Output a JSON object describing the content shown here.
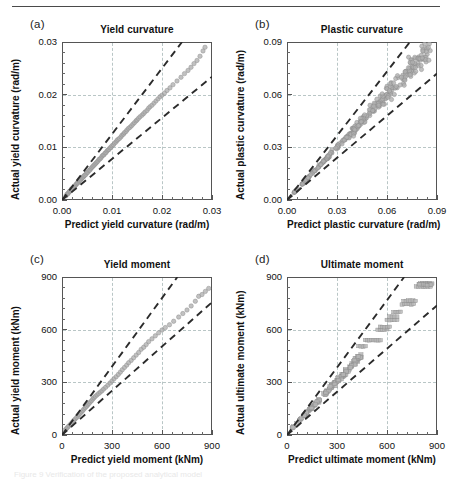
{
  "figure": {
    "rule": "horizontal-rule",
    "caption_faint": "Figure 9 Verification of the proposed analytical model"
  },
  "panels": [
    {
      "tag": "(a)",
      "title": "Yield curvature",
      "xlabel": "Predict yield curvature (rad/m)",
      "ylabel": "Actual yield curvature (rad/m)",
      "xticks": [
        "0.00",
        "0.01",
        "0.02",
        "0.03"
      ],
      "yticks": [
        "0.00",
        "0.01",
        "0.02",
        "0.03"
      ],
      "xlim": [
        0,
        0.03
      ],
      "ylim": [
        0,
        0.03
      ],
      "upper_band_slope": 1.25,
      "lower_band_slope": 0.78,
      "marker": "circle"
    },
    {
      "tag": "(b)",
      "title": "Plastic curvature",
      "xlabel": "Predict plastic curvature (rad/m)",
      "ylabel": "Actual plastic curvature (rad/m)",
      "xticks": [
        "0.00",
        "0.03",
        "0.06",
        "0.09"
      ],
      "yticks": [
        "0.00",
        "0.03",
        "0.06",
        "0.09"
      ],
      "xlim": [
        0,
        0.09
      ],
      "ylim": [
        0,
        0.09
      ],
      "upper_band_slope": 1.22,
      "lower_band_slope": 0.8,
      "marker": "circle"
    },
    {
      "tag": "(c)",
      "title": "Yield moment",
      "xlabel": "Predict yield moment (kNm)",
      "ylabel": "Actual yield moment (kNm)",
      "xticks": [
        "0",
        "300",
        "600",
        "900"
      ],
      "yticks": [
        "0",
        "300",
        "600",
        "900"
      ],
      "xlim": [
        0,
        900
      ],
      "ylim": [
        0,
        900
      ],
      "upper_band_slope": 1.3,
      "lower_band_slope": 0.84,
      "marker": "circle"
    },
    {
      "tag": "(d)",
      "title": "Ultimate moment",
      "xlabel": "Predict ultimate moment (kNm)",
      "ylabel": "Actual ultimate moment (kNm)",
      "xticks": [
        "0",
        "300",
        "600",
        "900"
      ],
      "yticks": [
        "0",
        "300",
        "600",
        "900"
      ],
      "xlim": [
        0,
        900
      ],
      "ylim": [
        0,
        900
      ],
      "upper_band_slope": 1.28,
      "lower_band_slope": 0.82,
      "marker": "square"
    }
  ],
  "chart_data": [
    {
      "type": "scatter",
      "panel": "(a)",
      "title": "Yield curvature",
      "xlabel": "Predict yield curvature (rad/m)",
      "ylabel": "Actual yield curvature (rad/m)",
      "xlim": [
        0,
        0.03
      ],
      "ylim": [
        0,
        0.03
      ],
      "xticks": [
        0,
        0.01,
        0.02,
        0.03
      ],
      "yticks": [
        0,
        0.01,
        0.02,
        0.03
      ],
      "grid": true,
      "legend": "none",
      "reference_lines": [
        {
          "name": "upper-bound",
          "style": "dashed",
          "slope": 1.25,
          "intercept": 0
        },
        {
          "name": "lower-bound",
          "style": "dashed",
          "slope": 0.78,
          "intercept": 0
        }
      ],
      "points": [
        [
          0.0008,
          0.0008
        ],
        [
          0.001,
          0.0011
        ],
        [
          0.0012,
          0.0012
        ],
        [
          0.0013,
          0.0014
        ],
        [
          0.0015,
          0.0016
        ],
        [
          0.0016,
          0.0017
        ],
        [
          0.0018,
          0.0018
        ],
        [
          0.0019,
          0.0021
        ],
        [
          0.002,
          0.0021
        ],
        [
          0.0022,
          0.0023
        ],
        [
          0.0023,
          0.0024
        ],
        [
          0.0025,
          0.0026
        ],
        [
          0.0026,
          0.0027
        ],
        [
          0.0028,
          0.0029
        ],
        [
          0.0029,
          0.0031
        ],
        [
          0.0031,
          0.0032
        ],
        [
          0.0032,
          0.0033
        ],
        [
          0.0034,
          0.0035
        ],
        [
          0.0035,
          0.0037
        ],
        [
          0.0037,
          0.0038
        ],
        [
          0.0038,
          0.004
        ],
        [
          0.004,
          0.0041
        ],
        [
          0.0041,
          0.0043
        ],
        [
          0.0043,
          0.0044
        ],
        [
          0.0044,
          0.0046
        ],
        [
          0.0046,
          0.0047
        ],
        [
          0.0048,
          0.0049
        ],
        [
          0.005,
          0.0052
        ],
        [
          0.0052,
          0.0053
        ],
        [
          0.0054,
          0.0056
        ],
        [
          0.0056,
          0.0057
        ],
        [
          0.0058,
          0.006
        ],
        [
          0.006,
          0.0062
        ],
        [
          0.0062,
          0.0064
        ],
        [
          0.0064,
          0.0066
        ],
        [
          0.0066,
          0.0068
        ],
        [
          0.0068,
          0.007
        ],
        [
          0.007,
          0.0072
        ],
        [
          0.0072,
          0.0074
        ],
        [
          0.0074,
          0.0077
        ],
        [
          0.0076,
          0.0078
        ],
        [
          0.0078,
          0.008
        ],
        [
          0.008,
          0.0083
        ],
        [
          0.0082,
          0.0085
        ],
        [
          0.0084,
          0.0086
        ],
        [
          0.0086,
          0.0089
        ],
        [
          0.0088,
          0.009
        ],
        [
          0.009,
          0.0093
        ],
        [
          0.0092,
          0.0095
        ],
        [
          0.0094,
          0.0096
        ],
        [
          0.0096,
          0.0099
        ],
        [
          0.0098,
          0.01
        ],
        [
          0.01,
          0.0103
        ],
        [
          0.0103,
          0.0105
        ],
        [
          0.0105,
          0.0108
        ],
        [
          0.0108,
          0.011
        ],
        [
          0.011,
          0.0113
        ],
        [
          0.0112,
          0.0115
        ],
        [
          0.0115,
          0.0117
        ],
        [
          0.0118,
          0.012
        ],
        [
          0.012,
          0.0123
        ],
        [
          0.0123,
          0.0125
        ],
        [
          0.0125,
          0.0128
        ],
        [
          0.0128,
          0.013
        ],
        [
          0.013,
          0.0133
        ],
        [
          0.0133,
          0.0136
        ],
        [
          0.0136,
          0.0138
        ],
        [
          0.0139,
          0.0141
        ],
        [
          0.0142,
          0.0144
        ],
        [
          0.0145,
          0.0147
        ],
        [
          0.0148,
          0.015
        ],
        [
          0.015,
          0.0152
        ],
        [
          0.0153,
          0.0155
        ],
        [
          0.0156,
          0.0158
        ],
        [
          0.016,
          0.0161
        ],
        [
          0.0163,
          0.0164
        ],
        [
          0.0166,
          0.0167
        ],
        [
          0.017,
          0.017
        ],
        [
          0.0173,
          0.0174
        ],
        [
          0.0176,
          0.0177
        ],
        [
          0.018,
          0.018
        ],
        [
          0.0184,
          0.0184
        ],
        [
          0.0188,
          0.0188
        ],
        [
          0.0192,
          0.0192
        ],
        [
          0.0196,
          0.0196
        ],
        [
          0.02,
          0.0199
        ],
        [
          0.0205,
          0.0203
        ],
        [
          0.021,
          0.0208
        ],
        [
          0.0216,
          0.0213
        ],
        [
          0.0222,
          0.0219
        ],
        [
          0.023,
          0.0226
        ],
        [
          0.0238,
          0.0233
        ],
        [
          0.0245,
          0.024
        ],
        [
          0.0252,
          0.0246
        ],
        [
          0.0258,
          0.0252
        ],
        [
          0.0264,
          0.0259
        ],
        [
          0.027,
          0.0265
        ],
        [
          0.0276,
          0.0273
        ],
        [
          0.0282,
          0.0283
        ],
        [
          0.0286,
          0.029
        ]
      ]
    },
    {
      "type": "scatter",
      "panel": "(b)",
      "title": "Plastic curvature",
      "xlabel": "Predict plastic curvature (rad/m)",
      "ylabel": "Actual plastic curvature (rad/m)",
      "xlim": [
        0,
        0.09
      ],
      "ylim": [
        0,
        0.09
      ],
      "xticks": [
        0,
        0.03,
        0.06,
        0.09
      ],
      "yticks": [
        0,
        0.03,
        0.06,
        0.09
      ],
      "grid": true,
      "legend": "none",
      "reference_lines": [
        {
          "name": "upper-bound",
          "style": "dashed",
          "slope": 1.22,
          "intercept": 0
        },
        {
          "name": "lower-bound",
          "style": "dashed",
          "slope": 0.8,
          "intercept": 0
        }
      ],
      "n_points": 260,
      "note": "dense cloud along 1:1 line between the two dashed bounds, spreading wider at high values"
    },
    {
      "type": "scatter",
      "panel": "(c)",
      "title": "Yield moment",
      "xlabel": "Predict yield moment (kNm)",
      "ylabel": "Actual yield moment (kNm)",
      "xlim": [
        0,
        900
      ],
      "ylim": [
        0,
        900
      ],
      "xticks": [
        0,
        300,
        600,
        900
      ],
      "yticks": [
        0,
        300,
        600,
        900
      ],
      "grid": true,
      "legend": "none",
      "reference_lines": [
        {
          "name": "upper-bound",
          "style": "dashed",
          "slope": 1.3,
          "intercept": 0
        },
        {
          "name": "lower-bound",
          "style": "dashed",
          "slope": 0.84,
          "intercept": 0
        }
      ],
      "points": [
        [
          20,
          30
        ],
        [
          28,
          38
        ],
        [
          35,
          45
        ],
        [
          42,
          52
        ],
        [
          50,
          60
        ],
        [
          58,
          68
        ],
        [
          65,
          76
        ],
        [
          72,
          84
        ],
        [
          80,
          92
        ],
        [
          88,
          100
        ],
        [
          95,
          108
        ],
        [
          102,
          116
        ],
        [
          110,
          124
        ],
        [
          118,
          132
        ],
        [
          125,
          140
        ],
        [
          132,
          148
        ],
        [
          140,
          156
        ],
        [
          148,
          164
        ],
        [
          155,
          172
        ],
        [
          162,
          180
        ],
        [
          170,
          188
        ],
        [
          178,
          196
        ],
        [
          185,
          205
        ],
        [
          192,
          212
        ],
        [
          200,
          220
        ],
        [
          210,
          228
        ],
        [
          220,
          236
        ],
        [
          230,
          244
        ],
        [
          240,
          252
        ],
        [
          250,
          262
        ],
        [
          262,
          272
        ],
        [
          275,
          284
        ],
        [
          288,
          296
        ],
        [
          300,
          308
        ],
        [
          312,
          320
        ],
        [
          325,
          332
        ],
        [
          338,
          345
        ],
        [
          350,
          358
        ],
        [
          362,
          372
        ],
        [
          375,
          385
        ],
        [
          388,
          398
        ],
        [
          400,
          412
        ],
        [
          415,
          425
        ],
        [
          430,
          440
        ],
        [
          445,
          455
        ],
        [
          460,
          470
        ],
        [
          475,
          488
        ],
        [
          490,
          500
        ],
        [
          505,
          515
        ],
        [
          520,
          532
        ],
        [
          540,
          548
        ],
        [
          560,
          565
        ],
        [
          580,
          582
        ],
        [
          600,
          598
        ],
        [
          620,
          612
        ],
        [
          645,
          628
        ],
        [
          670,
          648
        ],
        [
          700,
          672
        ],
        [
          725,
          692
        ],
        [
          750,
          712
        ],
        [
          775,
          735
        ],
        [
          800,
          762
        ],
        [
          820,
          790
        ],
        [
          840,
          800
        ],
        [
          860,
          818
        ],
        [
          880,
          835
        ]
      ]
    },
    {
      "type": "scatter",
      "panel": "(d)",
      "title": "Ultimate moment",
      "xlabel": "Predict ultimate moment (kNm)",
      "ylabel": "Actual ultimate moment (kNm)",
      "xlim": [
        0,
        900
      ],
      "ylim": [
        0,
        900
      ],
      "xticks": [
        0,
        300,
        600,
        900
      ],
      "yticks": [
        0,
        300,
        600,
        900
      ],
      "grid": true,
      "legend": "none",
      "reference_lines": [
        {
          "name": "upper-bound",
          "style": "dashed",
          "slope": 1.28,
          "intercept": 0
        },
        {
          "name": "lower-bound",
          "style": "dashed",
          "slope": 0.82,
          "intercept": 0
        }
      ],
      "note": "clustered cloud at low values; at high values points form discrete horizontal rows near y=500,530,600,610,650,680,740,760,840,860",
      "rows": [
        {
          "y": 505,
          "x_from": 430,
          "x_to": 470
        },
        {
          "y": 540,
          "x_from": 470,
          "x_to": 560
        },
        {
          "y": 600,
          "x_from": 545,
          "x_to": 600
        },
        {
          "y": 615,
          "x_from": 560,
          "x_to": 615
        },
        {
          "y": 655,
          "x_from": 600,
          "x_to": 660
        },
        {
          "y": 675,
          "x_from": 615,
          "x_to": 660
        },
        {
          "y": 700,
          "x_from": 640,
          "x_to": 680
        },
        {
          "y": 745,
          "x_from": 690,
          "x_to": 760
        },
        {
          "y": 765,
          "x_from": 700,
          "x_to": 770
        },
        {
          "y": 845,
          "x_from": 775,
          "x_to": 860
        },
        {
          "y": 865,
          "x_from": 800,
          "x_to": 870
        }
      ]
    }
  ]
}
